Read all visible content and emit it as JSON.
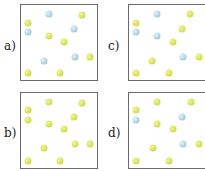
{
  "colors": {
    "yellow": "#d6e25a",
    "blue": "#aed3e3",
    "border": "#6a6a6a"
  },
  "panels": [
    {
      "id": "a",
      "label": "a)",
      "box": {
        "x": 20,
        "y": 4,
        "w": 78,
        "h": 77
      },
      "label_pos": {
        "x": 4,
        "y": 40
      },
      "dots": [
        {
          "x": 49,
          "y": 14,
          "c": "blue"
        },
        {
          "x": 82,
          "y": 15,
          "c": "yellow"
        },
        {
          "x": 28,
          "y": 23,
          "c": "yellow"
        },
        {
          "x": 28,
          "y": 32,
          "c": "blue"
        },
        {
          "x": 74,
          "y": 29,
          "c": "blue"
        },
        {
          "x": 49,
          "y": 36,
          "c": "yellow"
        },
        {
          "x": 64,
          "y": 42,
          "c": "yellow"
        },
        {
          "x": 44,
          "y": 61,
          "c": "blue"
        },
        {
          "x": 75,
          "y": 57,
          "c": "blue"
        },
        {
          "x": 90,
          "y": 57,
          "c": "yellow"
        },
        {
          "x": 28,
          "y": 73,
          "c": "yellow"
        },
        {
          "x": 60,
          "y": 73,
          "c": "yellow"
        }
      ]
    },
    {
      "id": "c",
      "label": "c)",
      "box": {
        "x": 128,
        "y": 4,
        "w": 80,
        "h": 77
      },
      "label_pos": {
        "x": 108,
        "y": 40
      },
      "dots": [
        {
          "x": 157,
          "y": 14,
          "c": "blue"
        },
        {
          "x": 190,
          "y": 14,
          "c": "yellow"
        },
        {
          "x": 136,
          "y": 23,
          "c": "yellow"
        },
        {
          "x": 136,
          "y": 32,
          "c": "blue"
        },
        {
          "x": 157,
          "y": 36,
          "c": "blue"
        },
        {
          "x": 182,
          "y": 29,
          "c": "yellow"
        },
        {
          "x": 173,
          "y": 42,
          "c": "yellow"
        },
        {
          "x": 183,
          "y": 57,
          "c": "blue"
        },
        {
          "x": 199,
          "y": 57,
          "c": "yellow"
        },
        {
          "x": 152,
          "y": 61,
          "c": "yellow"
        },
        {
          "x": 136,
          "y": 73,
          "c": "yellow"
        },
        {
          "x": 169,
          "y": 73,
          "c": "yellow"
        }
      ]
    },
    {
      "id": "b",
      "label": "b)",
      "box": {
        "x": 20,
        "y": 92,
        "w": 78,
        "h": 77
      },
      "label_pos": {
        "x": 4,
        "y": 127
      },
      "dots": [
        {
          "x": 49,
          "y": 102,
          "c": "yellow"
        },
        {
          "x": 82,
          "y": 103,
          "c": "yellow"
        },
        {
          "x": 28,
          "y": 110,
          "c": "yellow"
        },
        {
          "x": 28,
          "y": 120,
          "c": "yellow"
        },
        {
          "x": 74,
          "y": 117,
          "c": "yellow"
        },
        {
          "x": 49,
          "y": 124,
          "c": "yellow"
        },
        {
          "x": 64,
          "y": 129,
          "c": "yellow"
        },
        {
          "x": 44,
          "y": 148,
          "c": "yellow"
        },
        {
          "x": 75,
          "y": 144,
          "c": "yellow"
        },
        {
          "x": 90,
          "y": 144,
          "c": "yellow"
        },
        {
          "x": 28,
          "y": 161,
          "c": "yellow"
        },
        {
          "x": 60,
          "y": 161,
          "c": "yellow"
        }
      ]
    },
    {
      "id": "d",
      "label": "d)",
      "box": {
        "x": 128,
        "y": 92,
        "w": 80,
        "h": 77
      },
      "label_pos": {
        "x": 108,
        "y": 127
      },
      "dots": [
        {
          "x": 157,
          "y": 102,
          "c": "yellow"
        },
        {
          "x": 191,
          "y": 102,
          "c": "yellow"
        },
        {
          "x": 136,
          "y": 110,
          "c": "yellow"
        },
        {
          "x": 136,
          "y": 120,
          "c": "blue"
        },
        {
          "x": 157,
          "y": 124,
          "c": "yellow"
        },
        {
          "x": 182,
          "y": 117,
          "c": "blue"
        },
        {
          "x": 173,
          "y": 129,
          "c": "yellow"
        },
        {
          "x": 183,
          "y": 144,
          "c": "blue"
        },
        {
          "x": 199,
          "y": 144,
          "c": "yellow"
        },
        {
          "x": 153,
          "y": 148,
          "c": "yellow"
        },
        {
          "x": 136,
          "y": 161,
          "c": "yellow"
        },
        {
          "x": 169,
          "y": 161,
          "c": "yellow"
        }
      ]
    }
  ]
}
